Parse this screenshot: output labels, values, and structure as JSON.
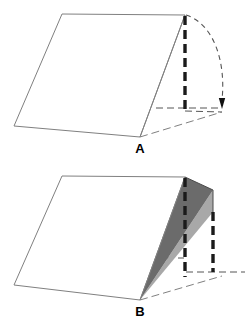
{
  "figure": {
    "title_text": "",
    "background_color": "#ffffff",
    "outline_color": "#808080",
    "dash_color": "#1a1a1a",
    "thin_dash_color": "#555555",
    "shade_dark_color": "#6b6b6b",
    "shade_light_color": "#a8a8a8",
    "panels": [
      {
        "id": "panel-a",
        "label": "A",
        "label_x": 140,
        "label_y": 153,
        "description": "Open wedge / tent shape with a vertical dashed edge on the right and a curved arrow sweeping clockwise from the top of that edge down to the base, indicating the folding motion.",
        "solid_outline_points": "62,14 185,15 140,137 14,126 62,14",
        "front_edge_points": "185,15 140,137",
        "base_far_points": "140,137 222,112",
        "base_right_points": "185,15 185,108",
        "vertical_dashed": {
          "x": 185,
          "y_top": 16,
          "y_bottom": 111
        },
        "horizontal_dashed": {
          "y": 108,
          "x_left": 156,
          "x_right": 221
        },
        "base_link_points": "185,111 222,112",
        "arc_path": "M 186 15 C 214 24, 226 62, 222 100",
        "arrow_tip": {
          "x": 222,
          "y": 109
        },
        "has_shading": false
      },
      {
        "id": "panel-b",
        "label": "B",
        "label_x": 140,
        "label_y": 316,
        "description": "Same wedge partially folded: two shaded triangular flaps (dark and light) fan out from the apex point B toward two vertical dashed posts at decreasing heights.",
        "solid_outline_points": "62,176 185,177 140,300 14,285 62,176",
        "front_edge_points": "185,177 140,300",
        "base_far_points": "140,300 222,276",
        "vertical_dashed_1": {
          "x": 185,
          "y_top": 178,
          "y_bottom": 277
        },
        "vertical_dashed_2": {
          "x": 213,
          "y_top": 212,
          "y_bottom": 272
        },
        "horizontal_dashed_1": {
          "y": 258,
          "x_left": 156,
          "x_right": 184
        },
        "horizontal_dashed_2": {
          "y": 272,
          "x_left": 186,
          "x_right": 245
        },
        "shade_dark_points": "140,300 185,177 213,190",
        "shade_light_points": "140,300 213,190 213,212",
        "cap_top_points": "185,177 213,190",
        "cap_mid_points": "213,190 213,212",
        "has_shading": true
      }
    ]
  }
}
